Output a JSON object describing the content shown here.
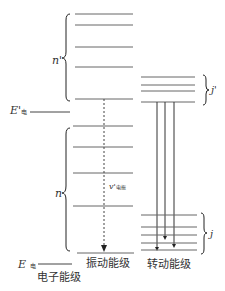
{
  "labels": {
    "n_prime": "n'",
    "n": "n",
    "E_prime": "E'",
    "E_prime_sub": "电",
    "E": "E",
    "E_sub": "电",
    "v_prime": "v'",
    "v_prime_sub": "电振",
    "j_prime": "j'",
    "j": "j",
    "electronic_levels": "电子能级",
    "vibrational_levels": "振动能级",
    "rotational_levels": "转动能级"
  },
  "diagram": {
    "line_color": "#555555",
    "upper_vibrational_levels_y": [
      14,
      25,
      47,
      67,
      99
    ],
    "lower_vibrational_levels_y": [
      126,
      147,
      173,
      206,
      253
    ],
    "upper_rotational_levels_y": [
      77,
      85,
      91,
      102
    ],
    "lower_rotational_levels_y": [
      215,
      227,
      235,
      243,
      250
    ],
    "transitions_x": [
      157,
      165,
      174
    ],
    "transitions_end_y": [
      250,
      239,
      247
    ]
  }
}
